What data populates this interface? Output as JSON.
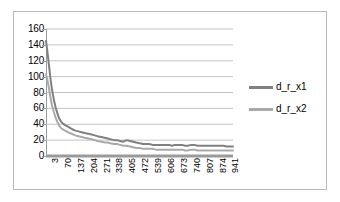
{
  "chart_data": {
    "type": "line",
    "title": "",
    "xlabel": "",
    "ylabel": "",
    "ylim": [
      0,
      160
    ],
    "ytick_step": 20,
    "yticks": [
      160,
      140,
      120,
      100,
      80,
      60,
      40,
      20,
      0
    ],
    "grid": true,
    "grid_axis": "y",
    "legend_position": "right",
    "xticks": [
      3,
      70,
      137,
      204,
      271,
      338,
      405,
      472,
      539,
      606,
      673,
      740,
      807,
      874,
      941
    ],
    "xtick_step": 67,
    "xlim": [
      3,
      975
    ],
    "series": [
      {
        "name": "d_r_x1",
        "color": "#808080",
        "x": [
          3,
          10,
          18,
          26,
          34,
          43,
          52,
          62,
          70,
          82,
          95,
          110,
          124,
          137,
          155,
          172,
          188,
          204,
          222,
          240,
          256,
          271,
          290,
          308,
          324,
          338,
          356,
          372,
          388,
          405,
          422,
          440,
          456,
          472,
          490,
          508,
          524,
          539,
          558,
          575,
          590,
          606,
          624,
          642,
          658,
          673,
          692,
          710,
          726,
          740,
          758,
          775,
          790,
          807,
          825,
          842,
          858,
          874,
          892,
          910,
          926,
          941,
          958,
          975
        ],
        "values": [
          145,
          132,
          115,
          98,
          84,
          72,
          62,
          54,
          48,
          43,
          40,
          38,
          36,
          34,
          32,
          31,
          30,
          29,
          28,
          27,
          26,
          25,
          24,
          23,
          22,
          21,
          20,
          20,
          19,
          18,
          20,
          19,
          18,
          17,
          16,
          15,
          15,
          15,
          14,
          14,
          14,
          14,
          14,
          14,
          13,
          14,
          14,
          14,
          13,
          13,
          14,
          14,
          13,
          13,
          13,
          13,
          13,
          13,
          13,
          13,
          13,
          12,
          12,
          12
        ]
      },
      {
        "name": "d_r_x2",
        "color": "#a9a9a9",
        "x": [
          3,
          10,
          18,
          26,
          34,
          43,
          52,
          62,
          70,
          82,
          95,
          110,
          124,
          137,
          155,
          172,
          188,
          204,
          222,
          240,
          256,
          271,
          290,
          308,
          324,
          338,
          356,
          372,
          388,
          405,
          422,
          440,
          456,
          472,
          490,
          508,
          524,
          539,
          558,
          575,
          590,
          606,
          624,
          642,
          658,
          673,
          692,
          710,
          726,
          740,
          758,
          775,
          790,
          807,
          825,
          842,
          858,
          874,
          892,
          910,
          926,
          941,
          958,
          975
        ],
        "values": [
          103,
          96,
          86,
          74,
          64,
          56,
          49,
          43,
          39,
          35,
          33,
          31,
          29,
          28,
          26,
          25,
          24,
          23,
          22,
          21,
          20,
          19,
          18,
          17,
          17,
          16,
          15,
          15,
          14,
          13,
          13,
          12,
          11,
          10,
          10,
          9,
          9,
          9,
          9,
          8,
          8,
          8,
          8,
          8,
          8,
          8,
          8,
          8,
          7,
          7,
          8,
          8,
          7,
          7,
          7,
          7,
          7,
          7,
          7,
          7,
          7,
          7,
          7,
          7
        ]
      }
    ],
    "axis_color": "#9a9a9a",
    "grid_color": "#b5b5b5",
    "frame_color": "#b9b9b9"
  },
  "legend": {
    "entries": [
      {
        "label": "d_r_x1"
      },
      {
        "label": "d_r_x2"
      }
    ]
  }
}
